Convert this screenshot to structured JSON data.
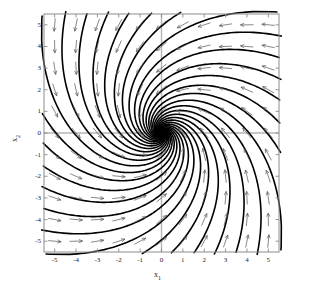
{
  "figure": {
    "name": "phase-portrait",
    "background": "#ffffff"
  },
  "chart_data": {
    "type": "scatter",
    "subtype": "phase-portrait-vector-field",
    "title": "",
    "subtitle": "",
    "xlabel": "x1",
    "ylabel": "x2",
    "xlabel_display": "x",
    "xlabel_sub": "1",
    "ylabel_display": "x",
    "ylabel_sub": "2",
    "xlim": [
      -5.5,
      5.5
    ],
    "ylim": [
      -5.5,
      5.5
    ],
    "grid": false,
    "legend": null,
    "legend_position": "none",
    "xticks": [
      -5,
      -4,
      -3,
      -2,
      -1,
      0,
      1,
      2,
      3,
      4,
      5
    ],
    "yticks": [
      -5,
      -4,
      -3,
      -2,
      -1,
      0,
      1,
      2,
      3,
      4,
      5
    ],
    "xticklabels": [
      "-5",
      "-4",
      "-3",
      "-2",
      "-1",
      "0",
      "1",
      "2",
      "3",
      "4",
      "5"
    ],
    "yticklabels": [
      "-5",
      "-4",
      "-3",
      "-2",
      "-1",
      "0",
      "1",
      "2",
      "3",
      "4",
      "5"
    ],
    "equilibrium": {
      "x": 0,
      "y": 0,
      "classification": "stable node"
    },
    "flow_direction": "inward",
    "trajectory_color": "#000000",
    "trajectory_width": 1.6,
    "arrow_color": "#555555",
    "arrow_width": 0.7,
    "axis_line_color": "#b4b4b4",
    "frame_color": "#8c8c8c",
    "system": {
      "a11": -1.0,
      "a12": -1.2,
      "a21": 1.2,
      "a22": -1.0
    },
    "trajectory_seed_count": 28,
    "arrow_grid_nx": 11,
    "arrow_grid_ny": 11,
    "series": [
      {
        "name": "trajectories",
        "description": "integral curves converging to the origin",
        "values": []
      },
      {
        "name": "direction-field",
        "description": "normalized arrow glyphs on an 11x11 grid",
        "values": []
      }
    ]
  },
  "axes": {
    "x_axis_name": "x-axis",
    "y_axis_name": "y-axis"
  }
}
